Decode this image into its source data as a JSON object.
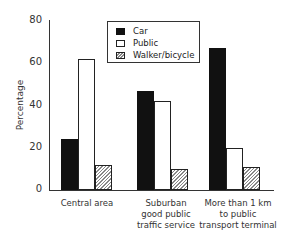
{
  "chart_data": {
    "type": "bar",
    "title": "",
    "xlabel": "",
    "ylabel": "Percentage",
    "ylim": [
      0,
      80
    ],
    "yticks": [
      "0",
      "20",
      "40",
      "60",
      "80"
    ],
    "categories": [
      "Central area",
      "Suburban good public traffic service",
      "More than 1 km to public transport terminal"
    ],
    "category_lines": [
      [
        "Central area"
      ],
      [
        "Suburban",
        "good public",
        "traffic service"
      ],
      [
        "More than 1 km",
        "to public",
        "transport terminal"
      ]
    ],
    "series": [
      {
        "name": "Car",
        "values": [
          24,
          47,
          67
        ]
      },
      {
        "name": "Public",
        "values": [
          62,
          42,
          20
        ]
      },
      {
        "name": "Walker/bicycle",
        "values": [
          12,
          10,
          11
        ]
      }
    ],
    "legend_position": "top-center",
    "grid": false
  }
}
